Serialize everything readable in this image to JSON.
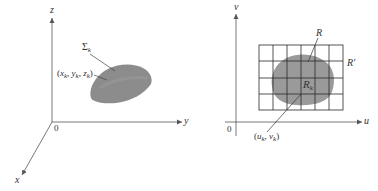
{
  "colors": {
    "axis": "#555555",
    "grid": "#2a2a2a",
    "surface_fill": "#8c8c8c",
    "region_fill": "#9a9a9a",
    "text": "#333333",
    "background": "#ffffff"
  },
  "left_panel": {
    "axes": {
      "z_label": "z",
      "y_label": "y",
      "x_label": "x",
      "origin_label": "0"
    },
    "surface_label": {
      "main": "Σ",
      "sub": "k"
    },
    "point_label": {
      "open": "(",
      "x": "x",
      "x_sub": "k",
      "sep1": ", ",
      "y": "y",
      "y_sub": "k",
      "sep2": ", ",
      "z": "z",
      "z_sub": "k",
      "close": ")"
    }
  },
  "right_panel": {
    "axes": {
      "v_label": "v",
      "u_label": "u",
      "origin_label": "0"
    },
    "region_label": "R",
    "rectangle_label": "R'",
    "subregion_label": {
      "main": "R",
      "sub": "k"
    },
    "point_label": {
      "open": "(",
      "u": "u",
      "u_sub": "k",
      "sep": ", ",
      "v": "v",
      "v_sub": "k",
      "close": ")"
    },
    "grid": {
      "columns": 6,
      "rows": 4
    }
  }
}
